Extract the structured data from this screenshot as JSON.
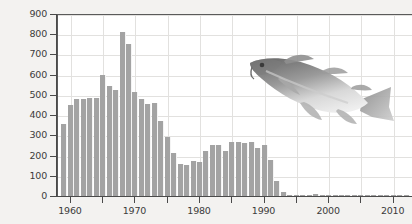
{
  "chart_data": {
    "type": "bar",
    "title": "",
    "xlabel": "",
    "ylabel": "Yield (thousands of metric tons)",
    "ylim": [
      0,
      900
    ],
    "xlim": [
      1958,
      2013
    ],
    "grid": true,
    "legend": "none",
    "y_ticks": [
      0,
      100,
      200,
      300,
      400,
      500,
      600,
      700,
      800,
      900
    ],
    "y_tick_labels": [
      "0",
      "100",
      "200",
      "300",
      "400",
      "500",
      "600",
      "700",
      "800",
      "900"
    ],
    "x_ticks": [
      1960,
      1965,
      1970,
      1975,
      1980,
      1985,
      1990,
      1995,
      2000,
      2005,
      2010
    ],
    "x_tick_labels": [
      "1960",
      "",
      "1970",
      "",
      "1980",
      "",
      "1990",
      "",
      "2000",
      "",
      "2010"
    ],
    "bar_color": "#a3a3a3",
    "categories": [
      1959,
      1960,
      1961,
      1962,
      1963,
      1964,
      1965,
      1966,
      1967,
      1968,
      1969,
      1970,
      1971,
      1972,
      1973,
      1974,
      1975,
      1976,
      1977,
      1978,
      1979,
      1980,
      1981,
      1982,
      1983,
      1984,
      1985,
      1986,
      1987,
      1988,
      1989,
      1990,
      1991,
      1992,
      1993,
      1994,
      1995,
      1996,
      1997,
      1998,
      1999,
      2000,
      2001,
      2002,
      2003,
      2004,
      2005,
      2006,
      2007,
      2008,
      2009,
      2010,
      2011,
      2012
    ],
    "values": [
      355,
      450,
      480,
      480,
      485,
      485,
      600,
      545,
      525,
      810,
      750,
      515,
      480,
      455,
      460,
      370,
      290,
      215,
      160,
      155,
      175,
      170,
      225,
      250,
      250,
      225,
      265,
      265,
      260,
      265,
      235,
      250,
      180,
      75,
      20,
      5,
      3,
      2,
      2,
      8,
      3,
      2,
      2,
      2,
      2,
      2,
      2,
      2,
      2,
      2,
      2,
      2,
      2,
      2
    ],
    "annotations": [
      {
        "type": "illustration",
        "name": "atlantic-cod-fish",
        "description": "Grey Atlantic cod illustration angled nose-down toward the left, overlaid on the upper plot area"
      }
    ]
  }
}
